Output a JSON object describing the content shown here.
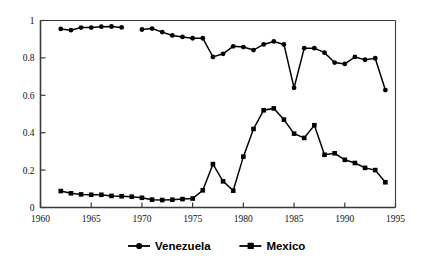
{
  "chart_data": {
    "type": "line",
    "title": "",
    "subtitle": "",
    "xlabel": "",
    "ylabel": "",
    "xlim": [
      1960,
      1995
    ],
    "ylim": [
      0,
      1
    ],
    "grid": false,
    "legend_position": "bottom",
    "x_ticks": [
      1960,
      1965,
      1970,
      1975,
      1980,
      1985,
      1990,
      1995
    ],
    "x_tick_labels": [
      "1960",
      "1965",
      "1970",
      "1975",
      "1980",
      "1985",
      "1990",
      "1995"
    ],
    "y_ticks": [
      0,
      0.2,
      0.4,
      0.6,
      0.8,
      1
    ],
    "y_tick_labels": [
      "0",
      "0.2",
      "0.4",
      "0.6",
      "0.8",
      "1"
    ],
    "series": [
      {
        "name": "Venezuela",
        "marker": "circle",
        "color": "#000000",
        "segments": [
          {
            "x": [
              1962,
              1963,
              1964,
              1965,
              1966,
              1967,
              1968
            ],
            "y": [
              0.955,
              0.948,
              0.962,
              0.962,
              0.967,
              0.968,
              0.963
            ]
          },
          {
            "x": [
              1970,
              1971,
              1972,
              1973,
              1974,
              1975,
              1976,
              1977,
              1978,
              1979,
              1980,
              1981,
              1982,
              1983,
              1984,
              1985,
              1986,
              1987,
              1988,
              1989,
              1990,
              1991,
              1992,
              1993,
              1994
            ],
            "y": [
              0.952,
              0.957,
              0.938,
              0.92,
              0.912,
              0.905,
              0.905,
              0.805,
              0.822,
              0.862,
              0.858,
              0.842,
              0.872,
              0.888,
              0.872,
              0.64,
              0.852,
              0.852,
              0.828,
              0.775,
              0.768,
              0.805,
              0.79,
              0.798,
              0.628
            ]
          }
        ]
      },
      {
        "name": "Mexico",
        "marker": "square",
        "color": "#000000",
        "segments": [
          {
            "x": [
              1962,
              1963,
              1964,
              1965,
              1966,
              1967,
              1968,
              1969,
              1970,
              1971,
              1972,
              1973,
              1974,
              1975,
              1976,
              1977,
              1978,
              1979,
              1980,
              1981,
              1982,
              1983,
              1984,
              1985,
              1986,
              1987,
              1988,
              1989,
              1990,
              1991,
              1992,
              1993,
              1994
            ],
            "y": [
              0.088,
              0.076,
              0.07,
              0.068,
              0.068,
              0.062,
              0.06,
              0.058,
              0.052,
              0.042,
              0.04,
              0.042,
              0.045,
              0.048,
              0.092,
              0.232,
              0.14,
              0.09,
              0.272,
              0.42,
              0.52,
              0.53,
              0.47,
              0.395,
              0.372,
              0.44,
              0.282,
              0.29,
              0.255,
              0.238,
              0.212,
              0.2,
              0.135,
              0.138
            ]
          }
        ]
      }
    ],
    "legend": [
      {
        "label": "Venezuela",
        "marker": "circle"
      },
      {
        "label": "Mexico",
        "marker": "square"
      }
    ]
  }
}
